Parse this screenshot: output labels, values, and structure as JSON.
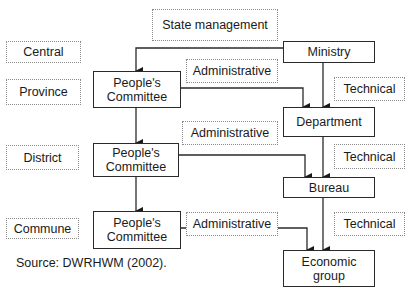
{
  "diagram": {
    "header": "State management",
    "levels": [
      {
        "id": "central",
        "label": "Central"
      },
      {
        "id": "province",
        "label": "Province"
      },
      {
        "id": "district",
        "label": "District"
      },
      {
        "id": "commune",
        "label": "Commune"
      }
    ],
    "nodes": {
      "ministry": "Ministry",
      "pc_province": "People's Committee",
      "pc_district": "People's Committee",
      "pc_commune": "People's Committee",
      "department": "Department",
      "bureau": "Bureau",
      "economic_group": "Economic group"
    },
    "edge_labels": {
      "admin1": "Administrative",
      "admin2": "Administrative",
      "admin3": "Administrative",
      "tech1": "Technical",
      "tech2": "Technical",
      "tech3": "Technical"
    },
    "edges": [
      {
        "from": "Ministry",
        "to": "People's Committee (Province)"
      },
      {
        "from": "Ministry",
        "to": "Department",
        "type": "Technical"
      },
      {
        "from": "People's Committee (Province)",
        "to": "Department",
        "type": "Administrative"
      },
      {
        "from": "People's Committee (Province)",
        "to": "People's Committee (District)"
      },
      {
        "from": "Department",
        "to": "Bureau",
        "type": "Technical"
      },
      {
        "from": "People's Committee (District)",
        "to": "Bureau",
        "type": "Administrative"
      },
      {
        "from": "People's Committee (District)",
        "to": "People's Committee (Commune)"
      },
      {
        "from": "Bureau",
        "to": "Economic group",
        "type": "Technical"
      },
      {
        "from": "People's Committee (Commune)",
        "to": "Economic group",
        "type": "Administrative"
      }
    ],
    "source": "Source: DWRHWM (2002)."
  }
}
